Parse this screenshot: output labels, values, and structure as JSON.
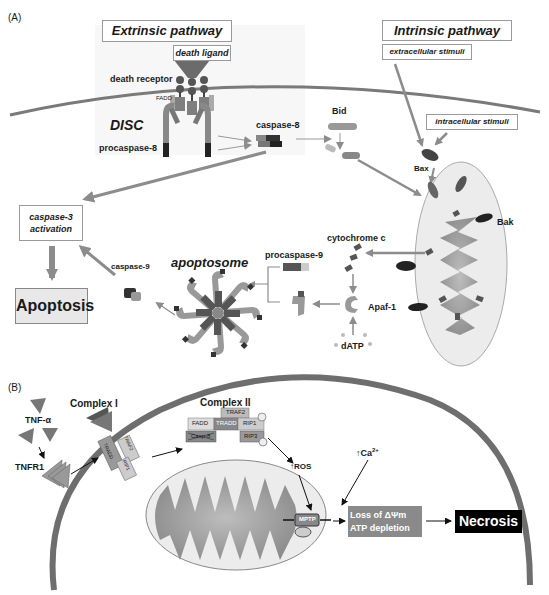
{
  "panelA": {
    "panel_label": "(A)",
    "extrinsic_title": "Extrinsic pathway",
    "intrinsic_title": "Intrinsic pathway",
    "death_ligand": "death ligand",
    "death_receptor": "death receptor",
    "fadd": "FADD",
    "disc": "DISC",
    "procaspase8": "procaspase-8",
    "caspase8": "caspase-8",
    "bid": "Bid",
    "extracellular_stimuli": "extracellular stimuli",
    "intracellular_stimuli": "intracellular stimuli",
    "bax": "Bax",
    "bak": "Bak",
    "cytochrome_c": "cytochrome c",
    "procaspase9": "procaspase-9",
    "apoptosome": "apoptosome",
    "apaf1": "Apaf-1",
    "datp": "dATP",
    "caspase9": "caspase-9",
    "caspase3_line1": "caspase-3",
    "caspase3_line2": "activation",
    "apoptosis": "Apoptosis"
  },
  "panelB": {
    "panel_label": "(B)",
    "tnf_alpha": "TNF-α",
    "tnfr1": "TNFR1",
    "complex1": "Complex I",
    "complex1_tradd": "TRADD",
    "complex1_traf2": "TRAF2",
    "complex1_rip1": "RIP1",
    "complex2": "Complex II",
    "complex2_traf2": "TRAF2",
    "complex2_fadd": "FADD",
    "complex2_tradd": "TRADD",
    "complex2_rip1": "RIP1",
    "complex2_rip3": "RIP3",
    "complex2_casp8": "Casp-8",
    "ros": "↑ROS",
    "ca_base": "↑Ca",
    "ca_sup": "2+",
    "mptp": "MPTP",
    "loss_line1": "Loss of ΔΨm",
    "loss_line2": "ATP depletion",
    "necrosis": "Necrosis"
  },
  "colors": {
    "membrane": "#7a7a7a",
    "arrow_grey": "#8c8c8c",
    "mito_fill": "#ebebeb",
    "cristae": "#9a9a9a",
    "apoptosis_bg": "#e8e8e8",
    "loss_bg": "#8a8a8a",
    "necrosis_bg": "#000000"
  }
}
